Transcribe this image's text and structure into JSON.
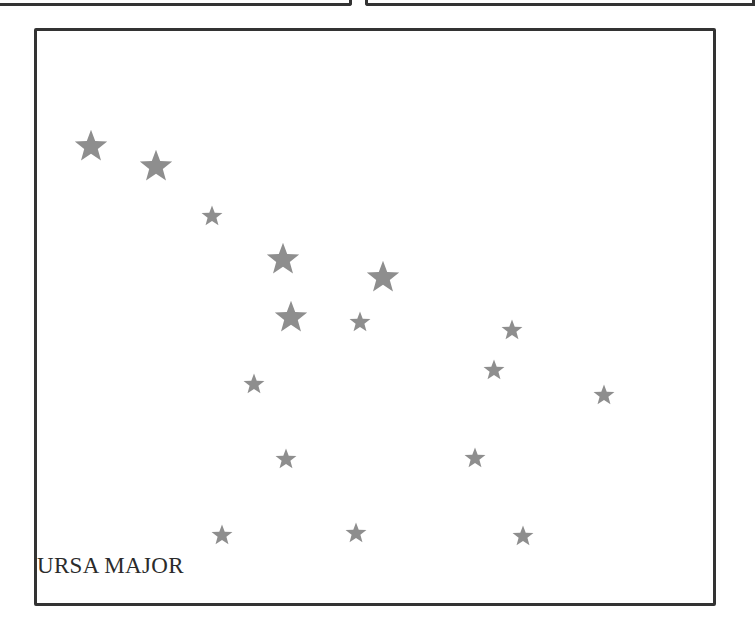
{
  "panel": {
    "label": "URSA MAJOR"
  },
  "colors": {
    "border": "#333333",
    "star": "#8e8e8e",
    "label": "#2b2b2b",
    "background": "#ffffff"
  },
  "stars": [
    {
      "x": 91,
      "y": 146,
      "size": 34
    },
    {
      "x": 156,
      "y": 166,
      "size": 34
    },
    {
      "x": 212,
      "y": 216,
      "size": 22
    },
    {
      "x": 283,
      "y": 259,
      "size": 34
    },
    {
      "x": 383,
      "y": 277,
      "size": 34
    },
    {
      "x": 291,
      "y": 317,
      "size": 34
    },
    {
      "x": 360,
      "y": 322,
      "size": 22
    },
    {
      "x": 512,
      "y": 330,
      "size": 22
    },
    {
      "x": 494,
      "y": 370,
      "size": 22
    },
    {
      "x": 254,
      "y": 384,
      "size": 22
    },
    {
      "x": 604,
      "y": 395,
      "size": 22
    },
    {
      "x": 286,
      "y": 459,
      "size": 22
    },
    {
      "x": 475,
      "y": 458,
      "size": 22
    },
    {
      "x": 222,
      "y": 535,
      "size": 22
    },
    {
      "x": 356,
      "y": 533,
      "size": 22
    },
    {
      "x": 523,
      "y": 536,
      "size": 22
    }
  ]
}
